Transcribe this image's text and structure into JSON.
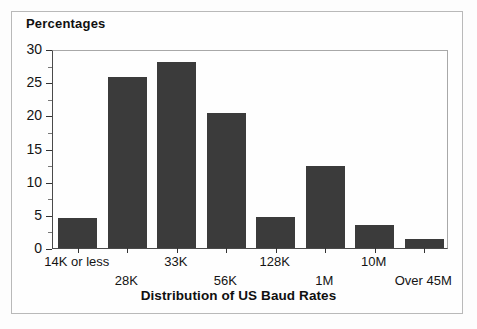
{
  "figure": {
    "background_color": "#fefefe",
    "frame_color": "#b9b9b9",
    "bar_color": "#3b3b3b",
    "axis_color": "#4a4a4a"
  },
  "chart_data": {
    "type": "bar",
    "title": "",
    "xlabel": "Distribution of US Baud Rates",
    "ylabel": "Percentages",
    "categories": [
      "14K or less",
      "28K",
      "33K",
      "56K",
      "128K",
      "1M",
      "10M",
      "Over 45M"
    ],
    "values": [
      4.6,
      25.8,
      28.1,
      20.3,
      4.7,
      12.4,
      3.4,
      1.4
    ],
    "ylim": [
      0,
      30
    ],
    "y_ticks": [
      0,
      5,
      10,
      15,
      20,
      25,
      30
    ],
    "y_tick_labels": [
      "0",
      "5",
      "10",
      "15",
      "20",
      "25",
      "30"
    ],
    "y_minor_step": 2.5,
    "grid": false,
    "legend": null,
    "bar_color": "#3b3b3b",
    "label_rows": [
      0,
      1,
      0,
      1,
      0,
      1,
      0,
      1
    ]
  }
}
